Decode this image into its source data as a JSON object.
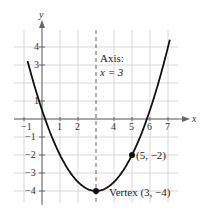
{
  "chart_data": {
    "type": "line",
    "title": "",
    "equation_hint": "y = 0.5(x-3)^2 - 4",
    "xlabel": "x",
    "ylabel": "y",
    "xlim": [
      -1,
      7
    ],
    "ylim": [
      -4,
      4
    ],
    "grid": true,
    "x_ticks": [
      "-1",
      "1",
      "2",
      "4",
      "5",
      "6",
      "7"
    ],
    "y_ticks": [
      "4",
      "3",
      "1",
      "-1",
      "-2",
      "-3",
      "-4"
    ],
    "series": [
      {
        "name": "parabola",
        "x": [
          -1,
          0,
          1,
          2,
          3,
          4,
          5,
          6,
          7
        ],
        "values": [
          4,
          0.5,
          -2,
          -3.5,
          -4,
          -3.5,
          -2,
          0.5,
          4
        ]
      }
    ],
    "points": [
      {
        "x": 3,
        "y": -4,
        "label": "Vertex (3, −4)"
      },
      {
        "x": 5,
        "y": -2,
        "label": "(5, −2)"
      }
    ],
    "annotations": {
      "axis_line1": "Axis:",
      "axis_line2": "x = 3",
      "axis_of_symmetry_x": 3
    }
  }
}
